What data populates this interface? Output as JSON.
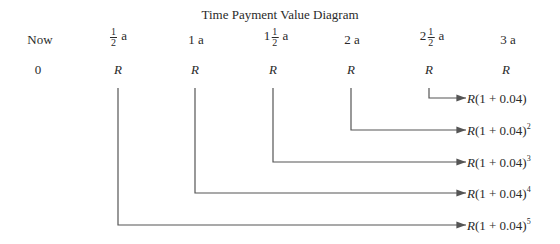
{
  "title": "Time Payment Value Diagram",
  "header_row": [
    {
      "label": "Now",
      "whole": "",
      "num": "",
      "den": "",
      "unit": ""
    },
    {
      "label": "",
      "whole": "",
      "num": "1",
      "den": "2",
      "unit": "a"
    },
    {
      "label": "1 a",
      "whole": "",
      "num": "",
      "den": "",
      "unit": ""
    },
    {
      "label": "",
      "whole": "1",
      "num": "1",
      "den": "2",
      "unit": "a"
    },
    {
      "label": "2 a",
      "whole": "",
      "num": "",
      "den": "",
      "unit": ""
    },
    {
      "label": "",
      "whole": "2",
      "num": "1",
      "den": "2",
      "unit": "a"
    },
    {
      "label": "3 a",
      "whole": "",
      "num": "",
      "den": "",
      "unit": ""
    }
  ],
  "payment_row": [
    "0",
    "R",
    "R",
    "R",
    "R",
    "R",
    "R"
  ],
  "results": [
    {
      "base": "R(1 + 0.04)",
      "exp": ""
    },
    {
      "base": "R(1 + 0.04)",
      "exp": "2"
    },
    {
      "base": "R(1 + 0.04)",
      "exp": "3"
    },
    {
      "base": "R(1 + 0.04)",
      "exp": "4"
    },
    {
      "base": "R(1 + 0.04)",
      "exp": "5"
    }
  ],
  "colors": {
    "line": "#555555",
    "text": "#2a2a2a"
  }
}
